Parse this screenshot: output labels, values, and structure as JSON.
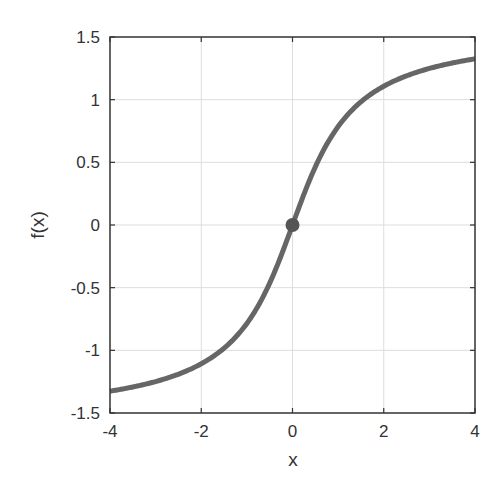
{
  "chart_data": {
    "type": "line",
    "title": "",
    "xlabel": "x",
    "ylabel": "f(x)",
    "xlim": [
      -4,
      4
    ],
    "ylim": [
      -1.5,
      1.5
    ],
    "grid": true,
    "legend": null,
    "xticks": [
      -4,
      -2,
      0,
      2,
      4
    ],
    "yticks": [
      -1.5,
      -1,
      -0.5,
      0,
      0.5,
      1,
      1.5
    ],
    "xtick_labels": [
      "-4",
      "-2",
      "0",
      "2",
      "4"
    ],
    "ytick_labels": [
      "-1.5",
      "-1",
      "-0.5",
      "0",
      "0.5",
      "1",
      "1.5"
    ],
    "series": [
      {
        "name": "f(x)",
        "function": "arctan(x)",
        "color": "#666666",
        "x": [
          -4,
          -3.5,
          -3,
          -2.5,
          -2,
          -1.5,
          -1,
          -0.5,
          0,
          0.5,
          1,
          1.5,
          2,
          2.5,
          3,
          3.5,
          4
        ],
        "y": [
          -1.33,
          -1.29,
          -1.25,
          -1.19,
          -1.11,
          -0.98,
          -0.79,
          -0.46,
          0,
          0.46,
          0.79,
          0.98,
          1.11,
          1.19,
          1.25,
          1.29,
          1.33
        ]
      }
    ],
    "annotations": [
      {
        "type": "marker",
        "x": 0,
        "y": 0,
        "shape": "circle",
        "color": "#555555"
      }
    ]
  },
  "colors": {
    "line": "#666666",
    "marker": "#555555",
    "axis": "#333333",
    "grid": "#dddddd"
  }
}
